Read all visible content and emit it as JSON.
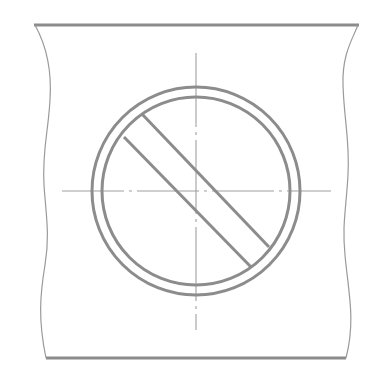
{
  "drawing": {
    "title": "Pipe section with crossed-out circle symbol",
    "colors": {
      "background": "#ffffff",
      "outline": "#8c8c8c",
      "thin_line": "#9a9a9a",
      "center_line": "#a0a0a0"
    },
    "pipe": {
      "top_edge": {
        "x1": 34,
        "y1": 25,
        "x2": 359,
        "y2": 25
      },
      "bottom_edge": {
        "x1": 46,
        "y1": 358,
        "x2": 346,
        "y2": 358
      },
      "left_break_path": "M35,25 C46,45 52,70 50,100 C48,135 42,150 44,185 C46,215 50,235 45,265 C40,295 38,320 46,358",
      "right_break_path": "M358,25 C352,40 342,55 343,85 C344,120 350,140 348,175 C346,210 342,225 345,255 C348,290 356,320 346,358"
    },
    "circle": {
      "cx": 196,
      "cy": 191,
      "outer_radius": 104,
      "inner_radius": 94
    },
    "diagonal_stripe": {
      "upper": {
        "x1": 142,
        "y1": 114,
        "x2": 269,
        "y2": 247
      },
      "lower": {
        "x1": 124,
        "y1": 137,
        "x2": 251,
        "y2": 267
      }
    },
    "center_lines": {
      "horizontal": {
        "x1": 62,
        "y1": 191,
        "x2": 331,
        "y2": 191,
        "dash": "62 5 3 5"
      },
      "vertical": {
        "x1": 196,
        "y1": 53,
        "x2": 196,
        "y2": 330,
        "dash": "74 5 3 5"
      }
    }
  }
}
